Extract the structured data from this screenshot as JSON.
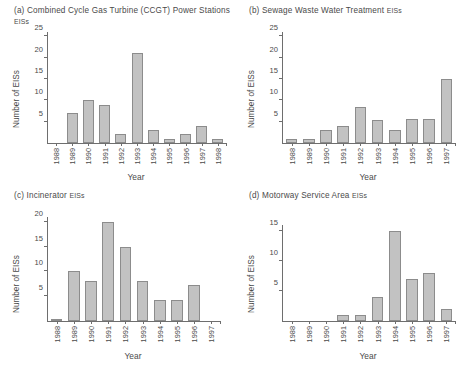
{
  "figure": {
    "panels": [
      "a",
      "b",
      "c",
      "d"
    ]
  },
  "panel_a": {
    "title_main": "(a) Combined Cycle Gas Turbine (CCGT) Power Stations ",
    "title_small": "EISs",
    "ylabel": "Number of EISs",
    "xlabel": "Year"
  },
  "panel_b": {
    "title_main": "(b) Sewage Waste Water Treatment ",
    "title_small": "EISs",
    "ylabel": "Number of EISs",
    "xlabel": "Year"
  },
  "panel_c": {
    "title_main": "(c) Incinerator ",
    "title_small": "EISs",
    "ylabel": "Number of EISs",
    "xlabel": "Year"
  },
  "panel_d": {
    "title_main": "(d) Motorway Service Area ",
    "title_small": "EISs",
    "ylabel": "Number of EISs",
    "xlabel": "Year"
  },
  "chart_data": [
    {
      "type": "bar",
      "panel": "a",
      "title": "(a) Combined Cycle Gas Turbine (CCGT) Power Stations EISs",
      "xlabel": "Year",
      "ylabel": "Number of EISs",
      "categories": [
        "1988",
        "1989",
        "1990",
        "1991",
        "1992",
        "1993",
        "1994",
        "1995",
        "1996",
        "1997",
        "1998"
      ],
      "values": [
        0,
        7,
        10,
        9,
        2,
        21,
        3,
        1,
        2,
        4,
        1
      ],
      "ylim": [
        0,
        26
      ],
      "yticks": [
        5,
        10,
        15,
        20,
        25
      ],
      "grid": false,
      "legend": "none"
    },
    {
      "type": "bar",
      "panel": "b",
      "title": "(b) Sewage Waste Water Treatment EISs",
      "xlabel": "Year",
      "ylabel": "Number of EISs",
      "categories": [
        "1988",
        "1989",
        "1990",
        "1991",
        "1992",
        "1993",
        "1994",
        "1995",
        "1996",
        "1997"
      ],
      "values": [
        1,
        1,
        3,
        4,
        8.5,
        5.5,
        3,
        5.7,
        5.7,
        15
      ],
      "ylim": [
        0,
        26
      ],
      "yticks": [
        5,
        10,
        15,
        20,
        25
      ],
      "grid": false,
      "legend": "none"
    },
    {
      "type": "bar",
      "panel": "c",
      "title": "(c) Incinerator EISs",
      "xlabel": "Year",
      "ylabel": "Number of EISs",
      "categories": [
        "1988",
        "1989",
        "1990",
        "1991",
        "1992",
        "1993",
        "1994",
        "1995",
        "1996",
        "1997"
      ],
      "values": [
        0.5,
        10,
        8,
        20,
        15,
        8,
        4.3,
        4.3,
        7.2,
        0
      ],
      "ylim": [
        0,
        21
      ],
      "yticks": [
        5,
        10,
        15,
        20
      ],
      "grid": false,
      "legend": "none"
    },
    {
      "type": "bar",
      "panel": "d",
      "title": "(d) Motorway Service Area EISs",
      "xlabel": "Year",
      "ylabel": "Number of EISs",
      "categories": [
        "1988",
        "1989",
        "1990",
        "1991",
        "1992",
        "1993",
        "1994",
        "1995",
        "1996",
        "1997"
      ],
      "values": [
        0,
        0,
        0,
        1,
        1,
        4,
        15,
        7,
        8,
        2
      ],
      "ylim": [
        0,
        16
      ],
      "yticks": [
        5,
        10,
        15
      ],
      "grid": false,
      "legend": "none"
    }
  ],
  "style": {
    "bar_fill": "#c2c2c2",
    "bar_stroke": "#8c8c8c",
    "axis_color": "#6e6e6e",
    "text_color": "#4a4a4a",
    "background": "#ffffff"
  }
}
